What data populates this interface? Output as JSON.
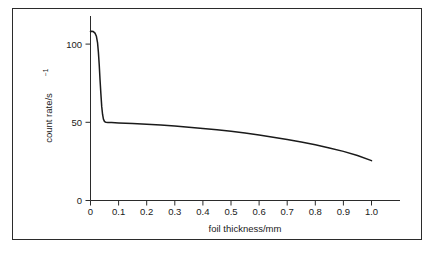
{
  "figure": {
    "border_color": "#2b2b2b",
    "background": "#ffffff"
  },
  "chart_data": {
    "type": "line",
    "title": "",
    "subtitle": "",
    "xlabel": "foil thickness/mm",
    "ylabel": "count rate/s",
    "ylabel_exponent": "−1",
    "xlim": [
      0,
      1.09
    ],
    "ylim": [
      0,
      118
    ],
    "xticks": [
      0,
      0.1,
      0.2,
      0.3,
      0.4,
      0.5,
      0.6,
      0.7,
      0.8,
      0.9,
      1.0
    ],
    "xtick_labels": [
      "0",
      "0.1",
      "0.2",
      "0.3",
      "0.4",
      "0.5",
      "0.6",
      "0.7",
      "0.8",
      "0.9",
      "1.0"
    ],
    "yticks": [
      0,
      50,
      100
    ],
    "ytick_labels": [
      "0",
      "50",
      "100"
    ],
    "grid": false,
    "legend": null,
    "line_color": "#1a1a1a",
    "series": [
      {
        "name": "count rate vs foil thickness",
        "x": [
          0.0,
          0.004,
          0.01,
          0.016,
          0.021,
          0.025,
          0.028,
          0.031,
          0.034,
          0.037,
          0.04,
          0.043,
          0.046,
          0.05,
          0.055,
          0.062,
          0.075,
          0.1,
          0.15,
          0.2,
          0.25,
          0.3,
          0.35,
          0.4,
          0.45,
          0.5,
          0.55,
          0.6,
          0.65,
          0.7,
          0.75,
          0.8,
          0.85,
          0.9,
          0.95,
          1.0
        ],
        "y": [
          108.0,
          108.2,
          108.0,
          107.0,
          105.0,
          101.0,
          95.0,
          87.0,
          77.0,
          68.0,
          60.0,
          55.0,
          52.0,
          50.4,
          50.0,
          49.9,
          49.8,
          49.6,
          49.2,
          48.7,
          48.2,
          47.6,
          46.9,
          46.1,
          45.2,
          44.2,
          43.1,
          41.9,
          40.5,
          39.0,
          37.4,
          35.6,
          33.6,
          31.4,
          28.8,
          25.5
        ]
      }
    ],
    "annotations": [
      {
        "text": "initial plateau near 108 s⁻¹ before sharp attenuation drop"
      },
      {
        "text": "plateau near 50 s⁻¹ from 0.05 mm onward, slowly decaying to ~25 s⁻¹ at 1.0 mm"
      }
    ]
  }
}
